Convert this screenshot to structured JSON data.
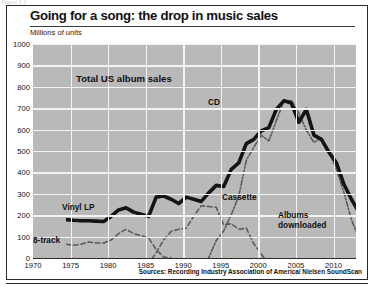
{
  "figure": {
    "pretitle": "Figure 1.1",
    "title": "Going for a song: the drop in music sales",
    "subtitle": "Millions of units",
    "source": "Sources: Recording Industry Association of America/ Nielsen SoundScan"
  },
  "annotations": {
    "total": "Total US album sales",
    "cd": "CD",
    "vinyl": "Vinyl LP",
    "cassette": "Cassette",
    "eight_track": "8-track",
    "downloads_line1": "Albums",
    "downloads_line2": "downloaded"
  },
  "colors": {
    "plot_background": "#b9b9b9",
    "gridline": "#f3f3f3",
    "total_line": "#141414",
    "cd_line": "#5a5a5a",
    "cassette_line": "#5a5a5a",
    "vinyl_line": "#4a4a4a",
    "eight_track_line": "#6e6e6e",
    "downloads_line": "#2f2f2f",
    "frame": "#2b2b2b",
    "text": "#111111"
  },
  "chart_data": {
    "type": "line",
    "title": "Going for a song: the drop in music sales",
    "subtitle": "Millions of units",
    "xlabel": "",
    "ylabel": "Millions of units",
    "xlim": [
      1970,
      2013
    ],
    "ylim": [
      0,
      1000
    ],
    "ytick_labels": [
      "0",
      "100",
      "200",
      "300",
      "400",
      "500",
      "600",
      "700",
      "800",
      "900",
      "1000"
    ],
    "yticks": [
      0,
      100,
      200,
      300,
      400,
      500,
      600,
      700,
      800,
      900,
      1000
    ],
    "xticks": [
      1970,
      1975,
      1980,
      1985,
      1990,
      1995,
      2000,
      2005,
      2010
    ],
    "xtick_labels": [
      "1970",
      "1975",
      "1980",
      "1985",
      "1990",
      "1995",
      "2000",
      "2005",
      "2010"
    ],
    "grid": true,
    "legend": "inline-annotations",
    "series": [
      {
        "name": "Total US album sales",
        "style": "solid-thick",
        "x": [
          1970,
          1971,
          1972,
          1973,
          1974,
          1975,
          1976,
          1977,
          1978,
          1979,
          1980,
          1981,
          1982,
          1983,
          1984,
          1985,
          1986,
          1987,
          1988,
          1989,
          1990,
          1991,
          1992,
          1993,
          1994,
          1995,
          1996,
          1997,
          1998,
          1999,
          2000,
          2001,
          2002,
          2003,
          2004,
          2005,
          2006,
          2007,
          2008,
          2009,
          2010,
          2011,
          2012
        ],
        "values": [
          385,
          382,
          380,
          380,
          378,
          376,
          400,
          430,
          440,
          420,
          410,
          400,
          490,
          495,
          480,
          460,
          490,
          480,
          470,
          510,
          545,
          540,
          620,
          650,
          740,
          760,
          800,
          815,
          900,
          940,
          930,
          840,
          900,
          780,
          760,
          700,
          650,
          550,
          480,
          420,
          370,
          340,
          330
        ]
      },
      {
        "name": "CD",
        "style": "dash-dot",
        "x": [
          1983,
          1984,
          1985,
          1986,
          1987,
          1988,
          1989,
          1990,
          1991,
          1992,
          1993,
          1994,
          1995,
          1996,
          1997,
          1998,
          1999,
          2000,
          2001,
          2002,
          2003,
          2004,
          2005,
          2006,
          2007,
          2008,
          2009,
          2010,
          2011,
          2012
        ],
        "values": [
          2,
          6,
          23,
          53,
          102,
          150,
          207,
          287,
          333,
          408,
          495,
          662,
          723,
          779,
          753,
          847,
          939,
          942,
          882,
          803,
          746,
          767,
          705,
          620,
          511,
          385,
          296,
          253,
          241,
          198
        ]
      },
      {
        "name": "Cassette",
        "style": "dashed",
        "x": [
          1970,
          1971,
          1972,
          1973,
          1974,
          1975,
          1976,
          1977,
          1978,
          1979,
          1980,
          1981,
          1982,
          1983,
          1984,
          1985,
          1986,
          1987,
          1988,
          1989,
          1990,
          1991,
          1992,
          1993,
          1994,
          1995,
          1996,
          1997,
          1998,
          1999,
          2000,
          2001,
          2002,
          2003,
          2004
        ],
        "values": [
          4,
          10,
          20,
          32,
          45,
          55,
          70,
          90,
          110,
          125,
          150,
          180,
          230,
          290,
          330,
          340,
          345,
          400,
          450,
          446,
          442,
          360,
          366,
          340,
          345,
          272,
          225,
          173,
          159,
          124,
          76,
          45,
          31,
          17,
          5
        ]
      },
      {
        "name": "Vinyl LP",
        "style": "dashed",
        "x": [
          1970,
          1971,
          1972,
          1973,
          1974,
          1975,
          1976,
          1977,
          1978,
          1979,
          1980,
          1981,
          1982,
          1983,
          1984,
          1985,
          1986,
          1987,
          1988,
          1989,
          1990,
          1991,
          1992,
          1993
        ],
        "values": [
          270,
          265,
          270,
          280,
          276,
          275,
          290,
          320,
          340,
          320,
          310,
          300,
          245,
          210,
          205,
          167,
          125,
          107,
          72,
          35,
          12,
          5,
          2,
          1
        ]
      },
      {
        "name": "8-track",
        "style": "dotted",
        "x": [
          1970,
          1971,
          1972,
          1973,
          1974,
          1975,
          1976,
          1977,
          1978,
          1979,
          1980,
          1981,
          1982,
          1983
        ],
        "values": [
          20,
          35,
          55,
          75,
          96,
          98,
          106,
          127,
          133,
          105,
          86,
          48,
          14,
          4
        ]
      },
      {
        "name": "Albums downloaded",
        "style": "solid",
        "x": [
          2003,
          2004,
          2005,
          2006,
          2007,
          2008,
          2009,
          2010,
          2011,
          2012
        ],
        "values": [
          5,
          16,
          27,
          40,
          50,
          66,
          76,
          86,
          104,
          118
        ]
      }
    ]
  }
}
